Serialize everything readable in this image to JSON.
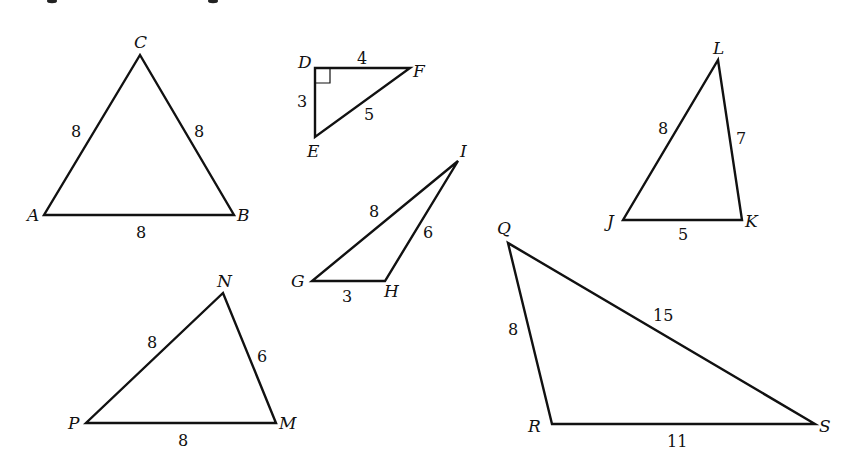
{
  "figure": {
    "top_crop_fragments": [
      {
        "x": 52,
        "y": 0
      },
      {
        "x": 213,
        "y": 0
      }
    ]
  },
  "triangles": [
    {
      "name": "ABC",
      "vertices": {
        "A": {
          "label": "A",
          "x": 44,
          "y": 215,
          "lx": 27,
          "ly": 221
        },
        "B": {
          "label": "B",
          "x": 234,
          "y": 215,
          "lx": 237,
          "ly": 221
        },
        "C": {
          "label": "C",
          "x": 140,
          "y": 55,
          "lx": 134,
          "ly": 48
        }
      },
      "sides": [
        {
          "between": "AC",
          "label": "8",
          "lx": 71,
          "ly": 137
        },
        {
          "between": "CB",
          "label": "8",
          "lx": 194,
          "ly": 137
        },
        {
          "between": "AB",
          "label": "8",
          "lx": 136,
          "ly": 238
        }
      ]
    },
    {
      "name": "DEF",
      "right_angle_at": "D",
      "vertices": {
        "D": {
          "label": "D",
          "x": 315,
          "y": 68,
          "lx": 298,
          "ly": 68
        },
        "E": {
          "label": "E",
          "x": 315,
          "y": 137,
          "lx": 307,
          "ly": 157
        },
        "F": {
          "label": "F",
          "x": 410,
          "y": 68,
          "lx": 413,
          "ly": 77
        }
      },
      "sides": [
        {
          "between": "DF",
          "label": "4",
          "lx": 357,
          "ly": 64
        },
        {
          "between": "DE",
          "label": "3",
          "lx": 297,
          "ly": 107
        },
        {
          "between": "EF",
          "label": "5",
          "lx": 364,
          "ly": 120
        }
      ]
    },
    {
      "name": "GHI",
      "vertices": {
        "G": {
          "label": "G",
          "x": 312,
          "y": 281,
          "lx": 291,
          "ly": 287
        },
        "H": {
          "label": "H",
          "x": 385,
          "y": 281,
          "lx": 384,
          "ly": 297
        },
        "I": {
          "label": "I",
          "x": 458,
          "y": 161,
          "lx": 460,
          "ly": 157
        }
      },
      "sides": [
        {
          "between": "GI",
          "label": "8",
          "lx": 369,
          "ly": 217
        },
        {
          "between": "HI",
          "label": "6",
          "lx": 423,
          "ly": 238
        },
        {
          "between": "GH",
          "label": "3",
          "lx": 342,
          "ly": 302
        }
      ]
    },
    {
      "name": "JKL",
      "vertices": {
        "J": {
          "label": "J",
          "x": 623,
          "y": 220,
          "lx": 607,
          "ly": 227
        },
        "K": {
          "label": "K",
          "x": 742,
          "y": 220,
          "lx": 745,
          "ly": 227
        },
        "L": {
          "label": "L",
          "x": 718,
          "y": 60,
          "lx": 713,
          "ly": 54
        }
      },
      "sides": [
        {
          "between": "JL",
          "label": "8",
          "lx": 658,
          "ly": 134
        },
        {
          "between": "KL",
          "label": "7",
          "lx": 736,
          "ly": 144
        },
        {
          "between": "JK",
          "label": "5",
          "lx": 678,
          "ly": 240
        }
      ]
    },
    {
      "name": "MNP",
      "vertices": {
        "M": {
          "label": "M",
          "x": 276,
          "y": 423,
          "lx": 279,
          "ly": 429
        },
        "N": {
          "label": "N",
          "x": 223,
          "y": 293,
          "lx": 217,
          "ly": 287
        },
        "P": {
          "label": "P",
          "x": 86,
          "y": 423,
          "lx": 68,
          "ly": 429
        }
      },
      "sides": [
        {
          "between": "PN",
          "label": "8",
          "lx": 147,
          "ly": 348
        },
        {
          "between": "NM",
          "label": "6",
          "lx": 257,
          "ly": 362
        },
        {
          "between": "PM",
          "label": "8",
          "lx": 178,
          "ly": 446
        }
      ]
    },
    {
      "name": "QRS",
      "vertices": {
        "Q": {
          "label": "Q",
          "x": 508,
          "y": 243,
          "lx": 497,
          "ly": 234
        },
        "R": {
          "label": "R",
          "x": 552,
          "y": 424,
          "lx": 528,
          "ly": 432
        },
        "S": {
          "label": "S",
          "x": 815,
          "y": 424,
          "lx": 819,
          "ly": 432
        },
        "_": {}
      },
      "sides": [
        {
          "between": "QR",
          "label": "8",
          "lx": 508,
          "ly": 335
        },
        {
          "between": "QS",
          "label": "15",
          "lx": 653,
          "ly": 321
        },
        {
          "between": "RS",
          "label": "11",
          "lx": 667,
          "ly": 447
        }
      ]
    }
  ]
}
